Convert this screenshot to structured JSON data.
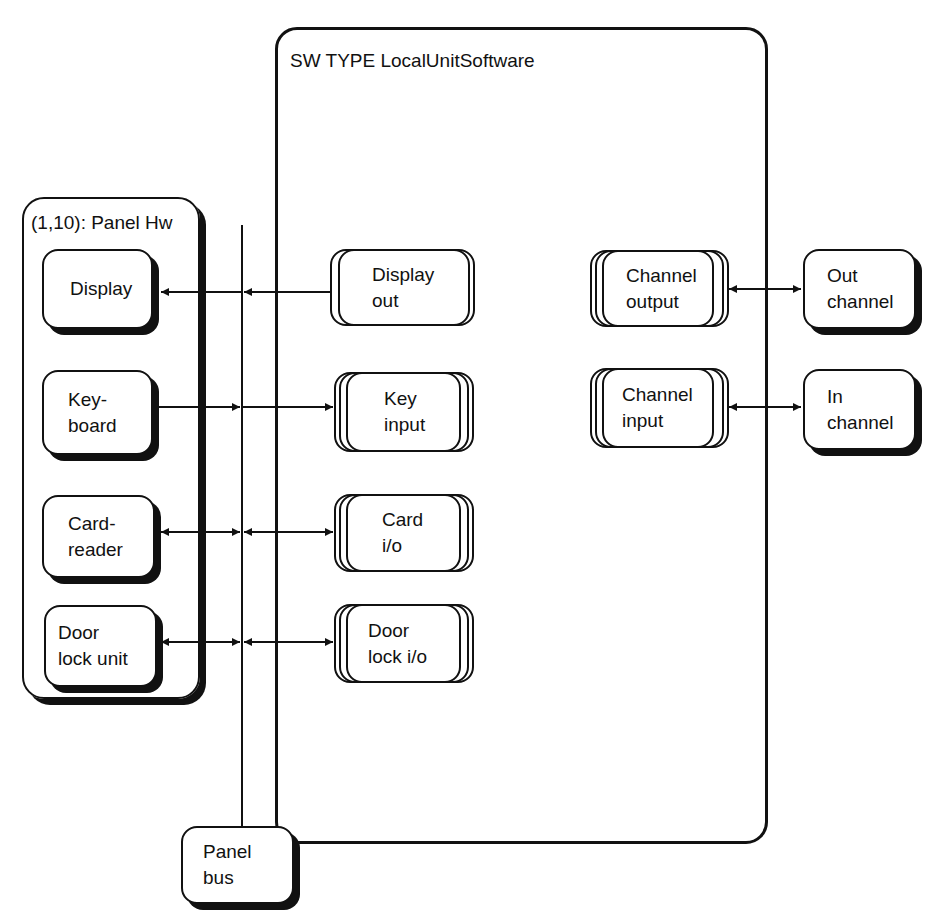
{
  "sw_type": {
    "label": "SW TYPE LocalUnitSoftware"
  },
  "panel_hw": {
    "label": "(1,10): Panel Hw"
  },
  "hardware_units": [
    {
      "id": "display",
      "lines": [
        "Display"
      ]
    },
    {
      "id": "keyboard",
      "lines": [
        "Key-",
        "board"
      ]
    },
    {
      "id": "card-reader",
      "lines": [
        "Card-",
        "reader"
      ]
    },
    {
      "id": "door-lock-unit",
      "lines": [
        "Door",
        "lock unit"
      ]
    }
  ],
  "software_processes": [
    {
      "id": "display-out",
      "lines": [
        "Display",
        "out"
      ]
    },
    {
      "id": "key-input",
      "lines": [
        "Key",
        "input"
      ]
    },
    {
      "id": "card-io",
      "lines": [
        "Card",
        "i/o"
      ]
    },
    {
      "id": "door-lock-io",
      "lines": [
        "Door",
        "lock i/o"
      ]
    },
    {
      "id": "channel-output",
      "lines": [
        "Channel",
        "output"
      ]
    },
    {
      "id": "channel-input",
      "lines": [
        "Channel",
        "input"
      ]
    }
  ],
  "channels": [
    {
      "id": "out-channel",
      "lines": [
        "Out",
        "channel"
      ]
    },
    {
      "id": "in-channel",
      "lines": [
        "In",
        "channel"
      ]
    }
  ],
  "panel_bus": {
    "lines": [
      "Panel",
      "bus"
    ]
  },
  "connections": [
    {
      "from": "display-out",
      "to": "display",
      "direction": "to-hardware"
    },
    {
      "from": "keyboard",
      "to": "key-input",
      "direction": "to-software"
    },
    {
      "from": "card-reader",
      "to": "card-io",
      "direction": "bidirectional"
    },
    {
      "from": "door-lock-unit",
      "to": "door-lock-io",
      "direction": "bidirectional"
    },
    {
      "from": "channel-output",
      "to": "out-channel",
      "direction": "bidirectional"
    },
    {
      "from": "channel-input",
      "to": "in-channel",
      "direction": "bidirectional"
    }
  ]
}
